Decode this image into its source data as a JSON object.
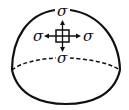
{
  "diagram": {
    "labels": {
      "top": "σ",
      "left": "σ",
      "right": "σ",
      "bottom": "σ"
    },
    "stroke_color": "#111111",
    "background": "#ffffff"
  }
}
